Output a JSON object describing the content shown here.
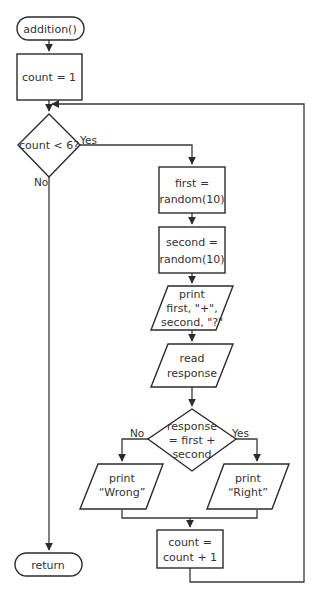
{
  "diagram": {
    "type": "flowchart",
    "nodes": {
      "start": {
        "shape": "terminal",
        "lines": [
          "addition()"
        ]
      },
      "init": {
        "shape": "process",
        "lines": [
          "count = 1"
        ]
      },
      "loop_check": {
        "shape": "decision",
        "lines": [
          "count < 6?"
        ]
      },
      "first": {
        "shape": "process",
        "lines": [
          "first =",
          "random(10)"
        ]
      },
      "second": {
        "shape": "process",
        "lines": [
          "second =",
          "random(10)"
        ]
      },
      "print_question": {
        "shape": "io",
        "lines": [
          "print",
          "first, \"+\",",
          "second, \"?\""
        ]
      },
      "read": {
        "shape": "io",
        "lines": [
          "read",
          "response"
        ]
      },
      "answer_check": {
        "shape": "decision",
        "lines": [
          "response",
          "= first +",
          "second"
        ]
      },
      "wrong": {
        "shape": "io",
        "lines": [
          "print",
          "“Wrong”"
        ]
      },
      "right": {
        "shape": "io",
        "lines": [
          "print",
          "“Right”"
        ]
      },
      "increment": {
        "shape": "process",
        "lines": [
          "count =",
          "count + 1"
        ]
      },
      "end": {
        "shape": "terminal",
        "lines": [
          "return"
        ]
      }
    },
    "edge_labels": {
      "loop_yes": "Yes",
      "loop_no": "No",
      "answer_no": "No",
      "answer_yes": "Yes"
    },
    "edges": [
      [
        "start",
        "init"
      ],
      [
        "init",
        "loop_check"
      ],
      [
        "loop_check",
        "first",
        "Yes"
      ],
      [
        "loop_check",
        "end",
        "No"
      ],
      [
        "first",
        "second"
      ],
      [
        "second",
        "print_question"
      ],
      [
        "print_question",
        "read"
      ],
      [
        "read",
        "answer_check"
      ],
      [
        "answer_check",
        "wrong",
        "No"
      ],
      [
        "answer_check",
        "right",
        "Yes"
      ],
      [
        "wrong",
        "increment"
      ],
      [
        "right",
        "increment"
      ],
      [
        "increment",
        "loop_check"
      ]
    ],
    "colors": {
      "line": "#2b2b2b",
      "text": "#333333",
      "background": "#ffffff"
    }
  }
}
